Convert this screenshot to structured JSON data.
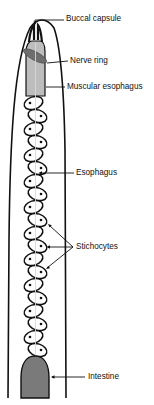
{
  "diagram": {
    "type": "anatomical-illustration",
    "colors": {
      "outline": "#111111",
      "esophagus_fill": "#bdbdbd",
      "nerve_ring_fill": "#6e6e6e",
      "intestine_fill": "#7a7a7a",
      "stichocyte_fill": "#ffffff",
      "center_line": "#d8d8d8",
      "background": "#ffffff"
    },
    "labels": [
      {
        "id": "buccal-capsule",
        "text": "Buccal capsule"
      },
      {
        "id": "nerve-ring",
        "text": "Nerve ring"
      },
      {
        "id": "muscular-esophagus",
        "text": "Muscular esophagus"
      },
      {
        "id": "esophagus",
        "text": "Esophagus"
      },
      {
        "id": "stichocytes",
        "text": "Stichocytes"
      },
      {
        "id": "intestine",
        "text": "Intestine"
      }
    ],
    "stichocyte_count": 20
  }
}
